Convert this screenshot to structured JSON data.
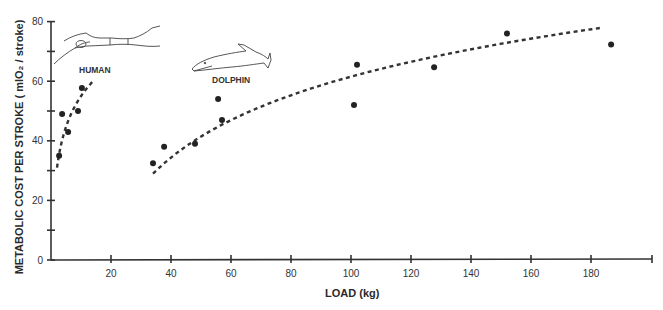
{
  "chart_data": {
    "type": "scatter",
    "title": "",
    "xlabel": "LOAD (kg)",
    "ylabel": "METABOLIC COST PER STROKE ( mlO₂ / stroke)",
    "xlim": [
      0,
      200
    ],
    "ylim": [
      0,
      80
    ],
    "x_ticks": [
      20,
      40,
      60,
      80,
      100,
      120,
      140,
      160,
      180
    ],
    "y_ticks": [
      0,
      20,
      40,
      60,
      80
    ],
    "y_minor_ticks": [
      10,
      30,
      50,
      70
    ],
    "grid": false,
    "legend": null,
    "annotations": [
      "HUMAN",
      "DOLPHIN"
    ],
    "series": [
      {
        "name": "HUMAN",
        "points": [
          [
            2.7,
            35
          ],
          [
            3.7,
            49
          ],
          [
            5.7,
            43
          ],
          [
            9,
            50
          ],
          [
            10.3,
            57.7
          ]
        ],
        "trend": {
          "style": "dashed",
          "x_range": [
            2,
            14
          ],
          "y_range": [
            31,
            60
          ]
        }
      },
      {
        "name": "DOLPHIN",
        "points": [
          [
            34,
            32.5
          ],
          [
            37.7,
            38
          ],
          [
            48,
            39
          ],
          [
            55.7,
            54
          ],
          [
            57,
            47
          ],
          [
            101,
            52
          ],
          [
            102,
            65.5
          ],
          [
            127.7,
            64.7
          ],
          [
            152,
            76
          ],
          [
            186.7,
            72.3
          ]
        ],
        "trend": {
          "style": "dashed",
          "x_range": [
            34,
            184
          ],
          "y_range": [
            29,
            78
          ]
        }
      }
    ]
  },
  "labels": {
    "xlabel": "LOAD (kg)",
    "ylabel": "METABOLIC COST PER STROKE ( mlO₂ / stroke)",
    "human": "HUMAN",
    "dolphin": "DOLPHIN"
  }
}
